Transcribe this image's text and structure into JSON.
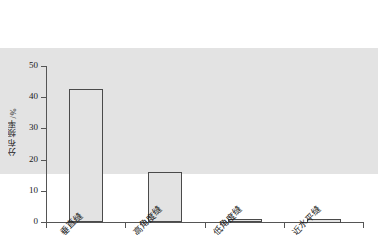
{
  "chart_data": {
    "type": "bar",
    "title": "",
    "subtitle": "",
    "xlabel": "",
    "ylabel": "分布频率/%",
    "categories": [
      "垂直缝",
      "高角度缝",
      "低角度缝",
      "近水平缝"
    ],
    "values": [
      40.5,
      42.5,
      16.0,
      0.8
    ],
    "ylim": [
      0,
      50
    ],
    "yticks": [
      0,
      10,
      20,
      30,
      40,
      50
    ],
    "ytick_labels": [
      "0",
      "10",
      "20",
      "30",
      "40",
      "50"
    ],
    "grid": false,
    "legend": null,
    "legend_position": "none",
    "annotations": [],
    "series": [
      {
        "name": "分布频率",
        "values": [
          40.5,
          42.5,
          16.0,
          0.8
        ]
      }
    ],
    "colors": {
      "bar_fill": "#e3e3e3",
      "bar_edge": "#4a4a4a",
      "axis": "#555555",
      "text": "#1a1a1a",
      "background": "#ffffff"
    }
  }
}
